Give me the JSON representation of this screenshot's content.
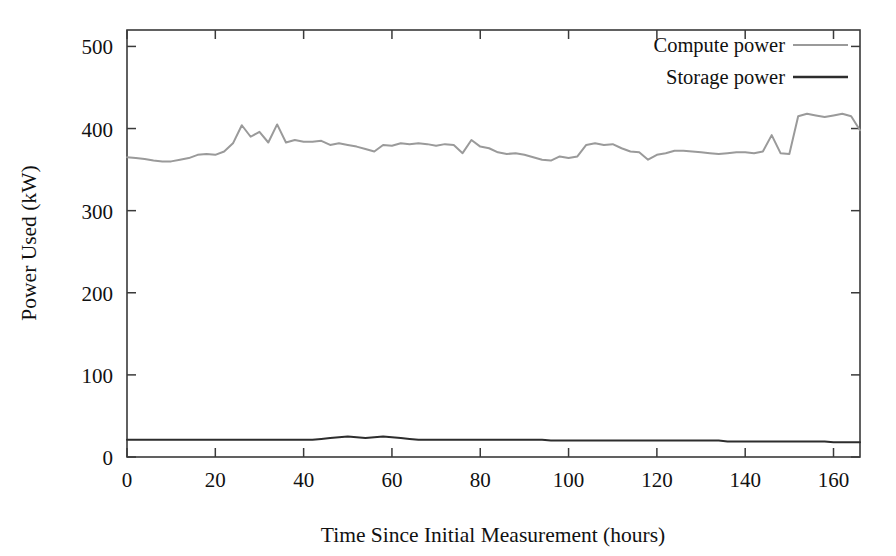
{
  "chart_data": {
    "type": "line",
    "title": "",
    "xlabel": "Time Since Initial Measurement (hours)",
    "ylabel": "Power Used (kW)",
    "xlim": [
      0,
      166
    ],
    "ylim": [
      0,
      520
    ],
    "xticks": [
      0,
      20,
      40,
      60,
      80,
      100,
      120,
      140,
      160
    ],
    "yticks": [
      0,
      100,
      200,
      300,
      400,
      500
    ],
    "xtick_labels": [
      "0",
      "20",
      "40",
      "60",
      "80",
      "100",
      "120",
      "140",
      "160"
    ],
    "ytick_labels": [
      "0",
      "100",
      "200",
      "300",
      "400",
      "500"
    ],
    "grid": false,
    "legend_position": "top-right",
    "frame": "box",
    "series": [
      {
        "name": "Compute power",
        "color": "#9a9a9a",
        "line_width": 2.0,
        "x": [
          0,
          2,
          4,
          6,
          8,
          10,
          12,
          14,
          16,
          18,
          20,
          22,
          24,
          26,
          28,
          30,
          32,
          34,
          36,
          38,
          40,
          42,
          44,
          46,
          48,
          50,
          52,
          54,
          56,
          58,
          60,
          62,
          64,
          66,
          68,
          70,
          72,
          74,
          76,
          78,
          80,
          82,
          84,
          86,
          88,
          90,
          92,
          94,
          96,
          98,
          100,
          102,
          104,
          106,
          108,
          110,
          112,
          114,
          116,
          118,
          120,
          122,
          124,
          126,
          128,
          130,
          132,
          134,
          136,
          138,
          140,
          142,
          144,
          146,
          148,
          150,
          152,
          154,
          156,
          158,
          160,
          162,
          164,
          166
        ],
        "y": [
          365,
          364,
          363,
          361,
          360,
          360,
          362,
          364,
          368,
          369,
          368,
          372,
          382,
          404,
          390,
          396,
          383,
          405,
          383,
          386,
          384,
          384,
          385,
          380,
          382,
          380,
          378,
          375,
          372,
          380,
          379,
          382,
          381,
          382,
          381,
          379,
          381,
          380,
          370,
          386,
          378,
          376,
          371,
          369,
          370,
          368,
          365,
          362,
          361,
          366,
          364,
          366,
          380,
          382,
          380,
          381,
          376,
          372,
          371,
          362,
          368,
          370,
          373,
          373,
          372,
          371,
          370,
          369,
          370,
          371,
          371,
          370,
          372,
          392,
          370,
          369,
          415,
          418,
          416,
          414,
          416,
          418,
          415,
          398
        ]
      },
      {
        "name": "Storage power",
        "color": "#2d2d2d",
        "line_width": 2.0,
        "x": [
          0,
          2,
          4,
          6,
          8,
          10,
          12,
          14,
          16,
          18,
          20,
          22,
          24,
          26,
          28,
          30,
          32,
          34,
          36,
          38,
          40,
          42,
          44,
          46,
          48,
          50,
          52,
          54,
          56,
          58,
          60,
          62,
          64,
          66,
          68,
          70,
          72,
          74,
          76,
          78,
          80,
          82,
          84,
          86,
          88,
          90,
          92,
          94,
          96,
          98,
          100,
          102,
          104,
          106,
          108,
          110,
          112,
          114,
          116,
          118,
          120,
          122,
          124,
          126,
          128,
          130,
          132,
          134,
          136,
          138,
          140,
          142,
          144,
          146,
          148,
          150,
          152,
          154,
          156,
          158,
          160,
          162,
          164,
          166
        ],
        "y": [
          21,
          21,
          21,
          21,
          21,
          21,
          21,
          21,
          21,
          21,
          21,
          21,
          21,
          21,
          21,
          21,
          21,
          21,
          21,
          21,
          21,
          21,
          22,
          23,
          24,
          25,
          24,
          23,
          24,
          25,
          24,
          23,
          22,
          21,
          21,
          21,
          21,
          21,
          21,
          21,
          21,
          21,
          21,
          21,
          21,
          21,
          21,
          21,
          20,
          20,
          20,
          20,
          20,
          20,
          20,
          20,
          20,
          20,
          20,
          20,
          20,
          20,
          20,
          20,
          20,
          20,
          20,
          20,
          19,
          19,
          19,
          19,
          19,
          19,
          19,
          19,
          19,
          19,
          19,
          19,
          18,
          18,
          18,
          18
        ]
      }
    ],
    "legend_entries": [
      {
        "label": "Compute power",
        "color": "#9a9a9a"
      },
      {
        "label": "Storage power",
        "color": "#2d2d2d"
      }
    ]
  },
  "axes": {
    "x_title": "Time Since Initial Measurement (hours)",
    "y_title": "Power Used (kW)"
  },
  "legend": {
    "entry_0_label": "Compute power",
    "entry_1_label": "Storage power"
  },
  "xticks": {
    "t0": "0",
    "t1": "20",
    "t2": "40",
    "t3": "60",
    "t4": "80",
    "t5": "100",
    "t6": "120",
    "t7": "140",
    "t8": "160"
  },
  "yticks": {
    "t0": "0",
    "t1": "100",
    "t2": "200",
    "t3": "300",
    "t4": "400",
    "t5": "500"
  },
  "colors": {
    "compute": "#9a9a9a",
    "storage": "#2d2d2d",
    "frame": "#3a3a3a",
    "background": "#ffffff"
  }
}
